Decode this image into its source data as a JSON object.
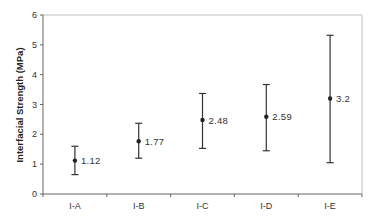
{
  "chart_data": {
    "type": "scatter",
    "subtype": "point-with-error-bars",
    "title": "",
    "xlabel": "",
    "ylabel": "Interfacial Strength (MPa)",
    "categories": [
      "I-A",
      "I-B",
      "I-C",
      "I-D",
      "I-E"
    ],
    "values": [
      1.12,
      1.77,
      2.48,
      2.59,
      3.2
    ],
    "data_labels": [
      "1.12",
      "1.77",
      "2.48",
      "2.59",
      "3.2"
    ],
    "error_low": [
      0.65,
      1.2,
      1.53,
      1.45,
      1.05
    ],
    "error_high": [
      1.6,
      2.37,
      3.37,
      3.67,
      5.32
    ],
    "ylim": [
      0,
      6
    ],
    "yticks": [
      0,
      1,
      2,
      3,
      4,
      5,
      6
    ],
    "ytick_labels": [
      "0",
      "1",
      "2",
      "3",
      "4",
      "5",
      "6"
    ],
    "grid": false,
    "legend": null,
    "colors": {
      "marker": "#222222",
      "errorbar": "#333333",
      "axis": "#666666",
      "frame": "#c0c0c0"
    }
  }
}
